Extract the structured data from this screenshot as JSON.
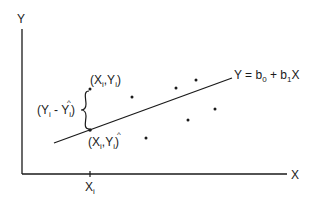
{
  "diagram": {
    "type": "regression-residual",
    "colors": {
      "ink": "#1a1a1a",
      "background": "#ffffff"
    },
    "axes": {
      "y_label": "Y",
      "x_label": "X",
      "x_tick_label_main": "X",
      "x_tick_label_sub": "i"
    },
    "regression_line": {
      "equation_prefix": "Y = b",
      "equation_sub0": "0",
      "equation_mid": " + b",
      "equation_sub1": "1",
      "equation_suffix": "X"
    },
    "observed_point": {
      "open": "(X",
      "sub1": "i",
      "comma": ",Y",
      "sub2": "i",
      "close": ")"
    },
    "fitted_point": {
      "open": "(X",
      "sub1": "i",
      "comma": ",",
      "hat_var": "Y",
      "hat": "^",
      "sub2": "i",
      "close": ")"
    },
    "residual_label": {
      "open": "(Y",
      "sub1": "i",
      "minus": " - ",
      "hat_var": "Y",
      "hat": "^",
      "sub2": "i",
      "close": ")"
    },
    "scatter_points": [
      {
        "x": 90,
        "y": 89
      },
      {
        "x": 132,
        "y": 97
      },
      {
        "x": 146,
        "y": 138
      },
      {
        "x": 176,
        "y": 88
      },
      {
        "x": 196,
        "y": 80
      },
      {
        "x": 188,
        "y": 120
      },
      {
        "x": 215,
        "y": 109
      },
      {
        "x": 90,
        "y": 130
      }
    ]
  }
}
